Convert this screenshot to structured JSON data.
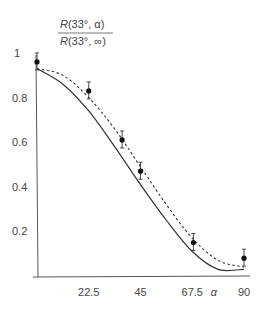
{
  "chart_data": {
    "type": "line",
    "title": "",
    "ylabel_numerator": "R(33°, α)",
    "ylabel_denominator": "R(33°, ∞)",
    "xlabel": "α",
    "x_ticks": [
      "22.5",
      "45",
      "67.5",
      "90"
    ],
    "y_ticks": [
      "0.2",
      "0.4",
      "0.6",
      "0.8",
      "1"
    ],
    "xlim": [
      0,
      92
    ],
    "ylim": [
      0,
      1
    ],
    "grid": false,
    "series": [
      {
        "name": "theory (solid)",
        "style": "solid",
        "x": [
          0,
          11.25,
          22.5,
          33.75,
          45,
          56.25,
          67.5,
          78.75,
          90
        ],
        "y": [
          0.93,
          0.86,
          0.74,
          0.58,
          0.41,
          0.25,
          0.11,
          0.03,
          0.03
        ]
      },
      {
        "name": "theory (dashed)",
        "style": "dashed",
        "x": [
          0,
          11.25,
          22.5,
          33.75,
          45,
          56.25,
          67.5,
          78.75,
          90
        ],
        "y": [
          0.93,
          0.9,
          0.8,
          0.66,
          0.49,
          0.32,
          0.17,
          0.07,
          0.04
        ]
      },
      {
        "name": "measured",
        "style": "points",
        "x": [
          0,
          22.5,
          37,
          45,
          68,
          90
        ],
        "y": [
          0.96,
          0.83,
          0.61,
          0.47,
          0.15,
          0.08
        ]
      }
    ]
  }
}
